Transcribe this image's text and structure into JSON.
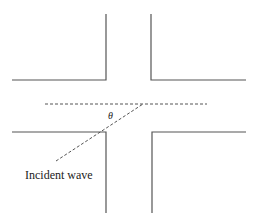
{
  "diagram": {
    "labels": {
      "angle": "θ",
      "incident_wave": "Incident wave"
    },
    "colors": {
      "line": "#555555",
      "text": "#222222",
      "background": "#ffffff"
    }
  }
}
